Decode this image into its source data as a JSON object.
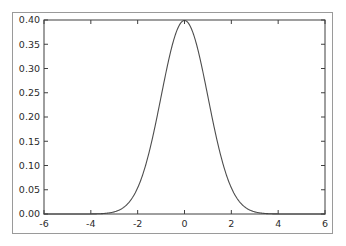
{
  "figure": {
    "background_color": "#ffffff",
    "frame_color": "#9a9a9a",
    "axes_color": "#3f3f3f",
    "curve_color": "#4d4d4d",
    "tick_label_color": "#2b2b2b"
  },
  "chart_data": {
    "type": "line",
    "title": "",
    "xlabel": "",
    "ylabel": "",
    "xlim": [
      -6,
      6
    ],
    "ylim": [
      0.0,
      0.4
    ],
    "grid": false,
    "legend": null,
    "xticks": [
      -6,
      -4,
      -2,
      0,
      2,
      4,
      6
    ],
    "xtick_labels": [
      "-6",
      "-4",
      "-2",
      "0",
      "2",
      "4",
      "6"
    ],
    "yticks": [
      0.0,
      0.05,
      0.1,
      0.15,
      0.2,
      0.25,
      0.3,
      0.35,
      0.4
    ],
    "ytick_labels": [
      "0.00",
      "0.05",
      "0.10",
      "0.15",
      "0.20",
      "0.25",
      "0.30",
      "0.35",
      "0.40"
    ],
    "series": [
      {
        "name": "standard normal pdf",
        "mean": 0,
        "sigma": 1,
        "x": [
          -6.0,
          -5.5,
          -5.0,
          -4.5,
          -4.0,
          -3.5,
          -3.0,
          -2.75,
          -2.5,
          -2.25,
          -2.0,
          -1.75,
          -1.5,
          -1.25,
          -1.0,
          -0.75,
          -0.5,
          -0.25,
          0.0,
          0.25,
          0.5,
          0.75,
          1.0,
          1.25,
          1.5,
          1.75,
          2.0,
          2.25,
          2.5,
          2.75,
          3.0,
          3.5,
          4.0,
          4.5,
          5.0,
          5.5,
          6.0
        ],
        "values": [
          0.0,
          0.0,
          0.0,
          0.0,
          0.0001,
          0.0009,
          0.0044,
          0.0091,
          0.0175,
          0.0317,
          0.054,
          0.0863,
          0.1295,
          0.1826,
          0.242,
          0.3011,
          0.3521,
          0.3867,
          0.3989,
          0.3867,
          0.3521,
          0.3011,
          0.242,
          0.1826,
          0.1295,
          0.0863,
          0.054,
          0.0317,
          0.0175,
          0.0091,
          0.0044,
          0.0009,
          0.0001,
          0.0,
          0.0,
          0.0,
          0.0
        ]
      }
    ]
  }
}
